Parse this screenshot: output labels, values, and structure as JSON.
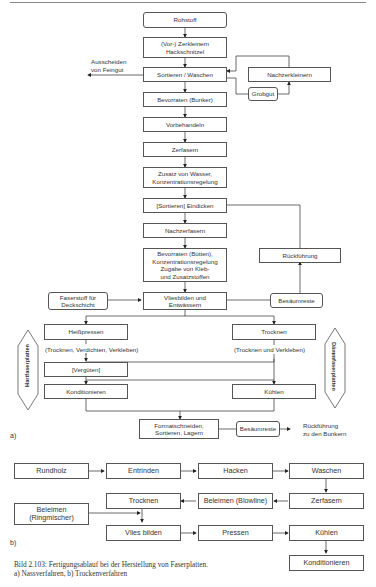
{
  "diagram_a": {
    "label": "a)",
    "nodes": {
      "rohstoff": "Rohstoff",
      "zerkleinern": "(Vor-) Zerkleinern\nHackschnitzel",
      "sortieren": "Sortieren / Waschen",
      "nachzerkleinern": "Nachzerkleinern",
      "grobgut": "Grobgut",
      "bevorraten_bunker": "Bevorraten (Bunker)",
      "vorbehandeln": "Vorbehandeln",
      "zerfasern": "Zerfasern",
      "zusatz": "Zusatz von Wasser,\nKonzentrationsregelung",
      "eindicken": "[Sortieren] Eindicken",
      "nachzerfasern": "Nachzerfasern",
      "bevorraten_butten": "Bevorraten (Bütten),\nKonzentrationsregelung\nZugabe von Kleb-\nund Zusatzstoffen",
      "rueckfuehrung": "Rückführung",
      "faserstoff": "Faserstoff für\nDeckschicht",
      "vliesbilden": "Vliesbilden und\nEntwässern",
      "besaeumreste1": "Besäumreste",
      "heisspressen": "Heißpressen",
      "trocknen": "Trocknen",
      "verguten": "[Vergüten]",
      "konditionieren": "Konditionieren",
      "kuehlen": "Kühlen",
      "formatschneiden": "Formatschneiden,\nSortieren, Lagern",
      "besaeumreste2": "Besäumreste"
    },
    "annotations": {
      "ausscheiden": "Ausscheiden\nvon Feingut",
      "heiss_note": "(Trocknen, Verdichten, Verkleben)",
      "trocknen_note": "(Trocknen und Verkleben)",
      "rueckfuehrung_bunker": "Rückführung\nzu den Bunkern",
      "side_left": "Hartfaserplatten",
      "side_right": "Dämmfaserplatten"
    }
  },
  "diagram_b": {
    "label": "b)",
    "nodes": {
      "rundholz": "Rundholz",
      "entrinden": "Entrinden",
      "hacken": "Hacken",
      "waschen": "Waschen",
      "zerfasern": "Zerfasern",
      "beleimen_blowline": "Beleimen (Blowline)",
      "trocknen": "Trocknen",
      "beleimen_ring": "Beleimen\n(Ringmischer)",
      "vies_bilden": "Vlies bilden",
      "pressen": "Pressen",
      "kuehlen": "Kühlen",
      "konditionieren": "Konditionieren"
    }
  },
  "caption": {
    "line1": "Bild 2.103:  Fertigungsablauf bei der Herstellung von Faserplatten.",
    "line2": "a) Nassverfahren, b) Trockenverfahren"
  }
}
